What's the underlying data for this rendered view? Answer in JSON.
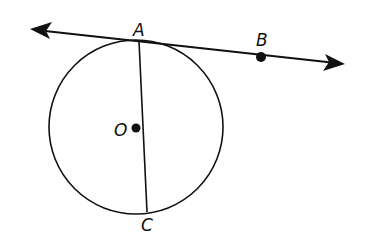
{
  "diagram": {
    "type": "circle-tangent-line",
    "labels": {
      "A": "A",
      "B": "B",
      "O": "O",
      "C": "C"
    },
    "elements": {
      "circle": {
        "center": "O",
        "description": "Circle with center O"
      },
      "tangent_line": {
        "through": [
          "A",
          "B"
        ],
        "description": "Line AB tangent to circle at A, arrows on both ends"
      },
      "segment": {
        "from": "A",
        "to": "C",
        "description": "Chord AC"
      }
    },
    "colors": {
      "stroke": "#111111",
      "background": "#ffffff"
    }
  }
}
